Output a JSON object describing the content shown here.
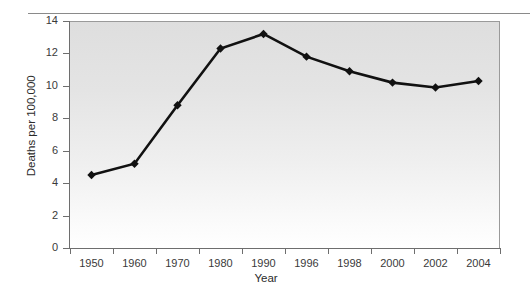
{
  "chart_data": {
    "type": "line",
    "title": "",
    "xlabel": "Year",
    "ylabel": "Deaths per 100,000",
    "categories": [
      "1950",
      "1960",
      "1970",
      "1980",
      "1990",
      "1996",
      "1998",
      "2000",
      "2002",
      "2004"
    ],
    "values": [
      4.5,
      5.2,
      8.8,
      12.3,
      13.2,
      11.8,
      10.9,
      10.2,
      9.9,
      10.3
    ],
    "ylim": [
      0,
      14
    ],
    "yticks": [
      "0",
      "2",
      "4",
      "6",
      "8",
      "10",
      "12",
      "14"
    ],
    "ytick_values": [
      0,
      2,
      4,
      6,
      8,
      10,
      12,
      14
    ],
    "grid": false,
    "legend": "none",
    "series": [
      {
        "name": "Deaths per 100,000",
        "values": [
          4.5,
          5.2,
          8.8,
          12.3,
          13.2,
          11.8,
          10.9,
          10.2,
          9.9,
          10.3
        ],
        "marker": "diamond",
        "color": "#111111"
      }
    ],
    "line_color": "#111111",
    "marker_color": "#111111",
    "plot_background": "#e4e4e4",
    "axis_color": "#6e6e6e"
  }
}
